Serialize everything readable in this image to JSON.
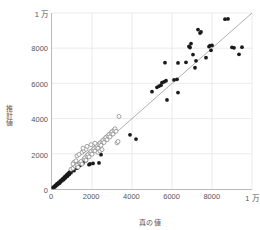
{
  "chart_data": {
    "type": "scatter",
    "title": "",
    "xlabel": "真の値",
    "ylabel": "推計値",
    "xlim": [
      0,
      10000
    ],
    "ylim": [
      0,
      10000
    ],
    "grid": true,
    "legend": "none",
    "xticks": [
      0,
      2000,
      4000,
      6000,
      8000,
      10000
    ],
    "xticklabels": [
      "0",
      "2000",
      "4000",
      "6000",
      "8000",
      "1 万"
    ],
    "yticks": [
      0,
      2000,
      4000,
      6000,
      8000,
      10000
    ],
    "yticklabels": [
      "0",
      "2000",
      "4000",
      "6000",
      "8000",
      "1 万"
    ],
    "annotations": [
      {
        "type": "reference-line",
        "label": "y = x",
        "from": [
          0,
          0
        ],
        "to": [
          10000,
          10000
        ]
      }
    ],
    "series": [
      {
        "name": "filled-markers",
        "marker": "filled-circle",
        "color": "#1a1a1a",
        "points": [
          [
            60,
            90
          ],
          [
            110,
            140
          ],
          [
            140,
            120
          ],
          [
            170,
            210
          ],
          [
            200,
            180
          ],
          [
            230,
            260
          ],
          [
            260,
            300
          ],
          [
            290,
            250
          ],
          [
            320,
            340
          ],
          [
            350,
            380
          ],
          [
            380,
            330
          ],
          [
            410,
            450
          ],
          [
            440,
            420
          ],
          [
            470,
            500
          ],
          [
            500,
            470
          ],
          [
            530,
            560
          ],
          [
            560,
            600
          ],
          [
            590,
            540
          ],
          [
            620,
            660
          ],
          [
            650,
            700
          ],
          [
            680,
            640
          ],
          [
            710,
            760
          ],
          [
            740,
            800
          ],
          [
            770,
            730
          ],
          [
            800,
            860
          ],
          [
            830,
            900
          ],
          [
            860,
            830
          ],
          [
            890,
            960
          ],
          [
            920,
            1000
          ],
          [
            950,
            930
          ],
          [
            1000,
            1080
          ],
          [
            1050,
            1120
          ],
          [
            1100,
            1040
          ],
          [
            1150,
            1220
          ],
          [
            1200,
            1260
          ],
          [
            1250,
            1180
          ],
          [
            1300,
            1380
          ],
          [
            1350,
            1420
          ],
          [
            1400,
            1340
          ],
          [
            1450,
            1500
          ],
          [
            1500,
            1560
          ],
          [
            1550,
            1480
          ],
          [
            1600,
            1660
          ],
          [
            1650,
            1700
          ],
          [
            1700,
            1620
          ],
          [
            1750,
            1800
          ],
          [
            1800,
            1860
          ],
          [
            1850,
            1380
          ],
          [
            1900,
            1420
          ],
          [
            2050,
            1450
          ],
          [
            2350,
            1480
          ],
          [
            2450,
            1950
          ],
          [
            3900,
            3080
          ],
          [
            4200,
            2840
          ],
          [
            5000,
            5530
          ],
          [
            5250,
            5780
          ],
          [
            5350,
            5840
          ],
          [
            5450,
            5900
          ],
          [
            5500,
            6040
          ],
          [
            5600,
            6090
          ],
          [
            5700,
            6150
          ],
          [
            5750,
            5060
          ],
          [
            5650,
            7180
          ],
          [
            6100,
            6200
          ],
          [
            6250,
            6230
          ],
          [
            6300,
            5480
          ],
          [
            6300,
            7160
          ],
          [
            6700,
            7200
          ],
          [
            6850,
            8100
          ],
          [
            6900,
            8040
          ],
          [
            6950,
            8260
          ],
          [
            7050,
            7640
          ],
          [
            7150,
            6890
          ],
          [
            7200,
            7280
          ],
          [
            7300,
            9060
          ],
          [
            7400,
            8860
          ],
          [
            7450,
            8920
          ],
          [
            7850,
            8090
          ],
          [
            7900,
            8150
          ],
          [
            7950,
            7880
          ],
          [
            7700,
            7460
          ],
          [
            8000,
            8160
          ],
          [
            8650,
            9650
          ],
          [
            8800,
            9660
          ],
          [
            9000,
            8050
          ],
          [
            9100,
            8020
          ],
          [
            9350,
            7650
          ],
          [
            9500,
            8060
          ]
        ]
      },
      {
        "name": "open-markers",
        "marker": "open-circle",
        "color": "#7d7d7d",
        "points": [
          [
            950,
            1120
          ],
          [
            1050,
            1180
          ],
          [
            1150,
            1300
          ],
          [
            1250,
            1360
          ],
          [
            1300,
            1240
          ],
          [
            1400,
            1480
          ],
          [
            1450,
            1560
          ],
          [
            1500,
            1420
          ],
          [
            1600,
            1700
          ],
          [
            1650,
            1780
          ],
          [
            1700,
            1640
          ],
          [
            1750,
            1880
          ],
          [
            1800,
            1960
          ],
          [
            1850,
            1820
          ],
          [
            1900,
            2060
          ],
          [
            1950,
            2140
          ],
          [
            2000,
            1980
          ],
          [
            2050,
            2220
          ],
          [
            2100,
            2300
          ],
          [
            2150,
            2160
          ],
          [
            2200,
            2380
          ],
          [
            2250,
            2460
          ],
          [
            2300,
            2320
          ],
          [
            2350,
            2540
          ],
          [
            2400,
            2620
          ],
          [
            2450,
            2480
          ],
          [
            2500,
            2700
          ],
          [
            2550,
            2780
          ],
          [
            2600,
            2640
          ],
          [
            2650,
            2860
          ],
          [
            2700,
            2940
          ],
          [
            2750,
            2800
          ],
          [
            2800,
            3020
          ],
          [
            2850,
            3100
          ],
          [
            2900,
            2960
          ],
          [
            2950,
            3180
          ],
          [
            3000,
            3260
          ],
          [
            3050,
            3120
          ],
          [
            3100,
            3340
          ],
          [
            3150,
            3420
          ],
          [
            3200,
            3280
          ],
          [
            3250,
            2620
          ],
          [
            3300,
            2700
          ],
          [
            3350,
            4120
          ],
          [
            1500,
            2080
          ],
          [
            1600,
            2180
          ],
          [
            1700,
            2260
          ],
          [
            1250,
            1880
          ],
          [
            1350,
            1960
          ],
          [
            2300,
            2080
          ],
          [
            2400,
            2160
          ],
          [
            2500,
            2240
          ],
          [
            1100,
            1520
          ],
          [
            1200,
            1600
          ],
          [
            1050,
            1420
          ],
          [
            1550,
            2320
          ],
          [
            1750,
            2420
          ],
          [
            1950,
            2520
          ],
          [
            2150,
            2600
          ]
        ]
      }
    ]
  }
}
